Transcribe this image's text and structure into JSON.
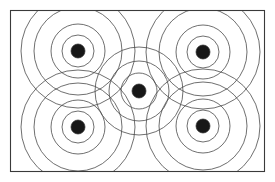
{
  "figure": {
    "background_color": "#ffffff",
    "line_color": "#4a4a4a",
    "boundary_color": "#3a3a3a",
    "core_fill_color": "#2b2b2b",
    "width": 275,
    "height": 182,
    "caption_partial": ""
  },
  "boundary": {
    "name": "rectangular-plot-boundary",
    "x": 10.5,
    "y": 10.5,
    "width": 254,
    "height": 161
  },
  "chart_data": {
    "type": "scatter",
    "xlabel": "",
    "ylabel": "",
    "grid": false,
    "legend": "none",
    "xlim": [
      10,
      265
    ],
    "ylim": [
      10,
      172
    ],
    "annotations": [],
    "ring_radii_center": [
      7,
      18,
      30,
      44
    ],
    "ring_radii_corner": [
      7,
      16,
      27,
      44,
      57
    ],
    "point_count": 5,
    "arrangement": "quincunx",
    "categories": [
      "top-left",
      "top-right",
      "center",
      "bottom-left",
      "bottom-right"
    ],
    "points": [
      {
        "label": "top-left",
        "x": 78,
        "y": 51,
        "radii": [
          7,
          16,
          27,
          44,
          57
        ]
      },
      {
        "label": "top-right",
        "x": 203,
        "y": 52,
        "radii": [
          7,
          16,
          27,
          44,
          57
        ]
      },
      {
        "label": "center",
        "x": 139,
        "y": 91,
        "radii": [
          7,
          18,
          30,
          44
        ]
      },
      {
        "label": "bottom-left",
        "x": 78,
        "y": 127,
        "radii": [
          7,
          16,
          27,
          44,
          57
        ]
      },
      {
        "label": "bottom-right",
        "x": 203,
        "y": 126,
        "radii": [
          7,
          16,
          27,
          44,
          57
        ]
      }
    ]
  }
}
